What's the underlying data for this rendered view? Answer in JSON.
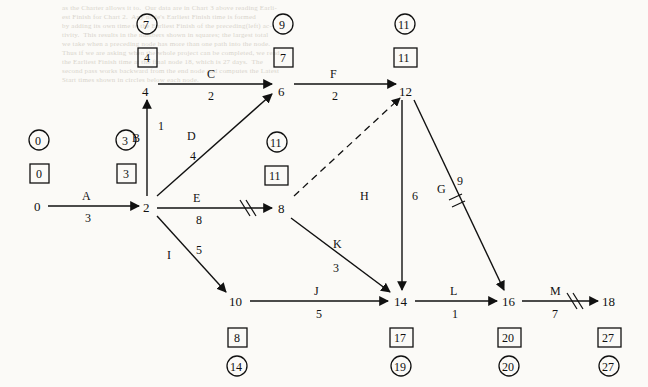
{
  "background_text": {
    "lines": [
      "as the Charter allows it to.  Our data are in Chart 3 above reading Earli-",
      "est Finish for Chart 2.  Any node's Earliest Finish time is formed",
      "by adding its own time to the Earliest Finish of the preceding(left) ac-",
      "tivity.  This results in the numbers shown in squares; the largest total",
      "we take when a preceding node has more than one path into the node.",
      "Thus if we are asking when the whole project can be completed, we read",
      "the Earliest Finish time at the final node 18, which is 27 days.  The",
      "second pass works backward from the end node and computes the Latest",
      "Start times shown in circles below each node."
    ]
  },
  "diagram": {
    "type": "activity-on-arrow-network",
    "nodes": [
      {
        "id": "0",
        "label": "0",
        "x": 40,
        "y": 205,
        "earliest": "0",
        "latest": "0",
        "earliest_pos": "above",
        "latest_pos": "above"
      },
      {
        "id": "2",
        "label": "2",
        "x": 148,
        "y": 205,
        "earliest": "3",
        "latest": "3",
        "earliest_pos": "above",
        "latest_pos": "above"
      },
      {
        "id": "4",
        "label": "4",
        "x": 148,
        "y": 89,
        "earliest": "4",
        "latest": "7",
        "earliest_pos": "above",
        "latest_pos": "above"
      },
      {
        "id": "6",
        "label": "6",
        "x": 283,
        "y": 89,
        "earliest": "7",
        "latest": "9",
        "earliest_pos": "above",
        "latest_pos": "above"
      },
      {
        "id": "8",
        "label": "8",
        "x": 283,
        "y": 207,
        "earliest": "11",
        "latest": "11",
        "earliest_pos": "above",
        "latest_pos": "above"
      },
      {
        "id": "10",
        "label": "10",
        "x": 235,
        "y": 301,
        "earliest": "8",
        "latest": "14",
        "earliest_pos": "below",
        "latest_pos": "below"
      },
      {
        "id": "12",
        "label": "12",
        "x": 405,
        "y": 89,
        "earliest": "11",
        "latest": "11",
        "earliest_pos": "above",
        "latest_pos": "above"
      },
      {
        "id": "14",
        "label": "14",
        "x": 400,
        "y": 301,
        "earliest": "17",
        "latest": "19",
        "earliest_pos": "below",
        "latest_pos": "below"
      },
      {
        "id": "16",
        "label": "16",
        "x": 508,
        "y": 301,
        "earliest": "20",
        "latest": "20",
        "earliest_pos": "below",
        "latest_pos": "below"
      },
      {
        "id": "18",
        "label": "18",
        "x": 608,
        "y": 301,
        "earliest": "27",
        "latest": "27",
        "earliest_pos": "below",
        "latest_pos": "below"
      }
    ],
    "edges": [
      {
        "name": "A",
        "from": "0",
        "to": "2",
        "duration": "3",
        "style": "solid",
        "slash": false
      },
      {
        "name": "B",
        "from": "2",
        "to": "4",
        "duration": "1",
        "style": "solid",
        "slash": false
      },
      {
        "name": "C",
        "from": "4",
        "to": "6",
        "duration": "2",
        "style": "solid",
        "slash": false
      },
      {
        "name": "D",
        "from": "2",
        "to": "6",
        "duration": "4",
        "style": "solid",
        "slash": false
      },
      {
        "name": "E",
        "from": "2",
        "to": "8",
        "duration": "8",
        "style": "solid",
        "slash": true
      },
      {
        "name": "F",
        "from": "6",
        "to": "12",
        "duration": "2",
        "style": "solid",
        "slash": false
      },
      {
        "name": "G",
        "from": "12",
        "to": "16",
        "duration": "9",
        "style": "solid",
        "slash": true
      },
      {
        "name": "H",
        "from": "12",
        "to": "14",
        "duration": "6",
        "style": "solid",
        "slash": false
      },
      {
        "name": "I",
        "from": "2",
        "to": "10",
        "duration": "5",
        "style": "solid",
        "slash": false
      },
      {
        "name": "J",
        "from": "10",
        "to": "14",
        "duration": "5",
        "style": "solid",
        "slash": false
      },
      {
        "name": "K",
        "from": "8",
        "to": "14",
        "duration": "3",
        "style": "solid",
        "slash": false
      },
      {
        "name": "L",
        "from": "14",
        "to": "16",
        "duration": "1",
        "style": "solid",
        "slash": false
      },
      {
        "name": "M",
        "from": "16",
        "to": "18",
        "duration": "7",
        "style": "solid",
        "slash": true
      },
      {
        "name": "",
        "from": "8",
        "to": "12",
        "duration": "",
        "style": "dashed",
        "slash": false
      }
    ]
  }
}
